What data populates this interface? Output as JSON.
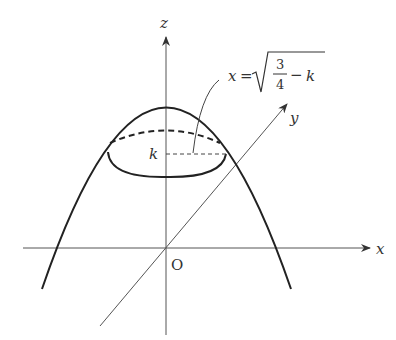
{
  "diagram": {
    "type": "3d-coordinate-sketch",
    "axes": {
      "x_label": "x",
      "y_label": "y",
      "z_label": "z",
      "origin_label": "O"
    },
    "level_label": "k",
    "annotation": {
      "lhs": "x",
      "equals": "=",
      "fraction_numerator": "3",
      "fraction_denominator": "4",
      "minus": "−",
      "variable": "k",
      "full_text": "x = √(3/4 − k)"
    },
    "colors": {
      "curve": "#222222",
      "axis": "#555555",
      "background": "#ffffff"
    }
  }
}
